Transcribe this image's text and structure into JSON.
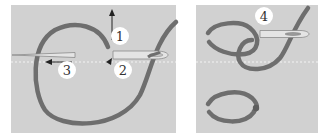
{
  "diagram": {
    "colors": {
      "background": "#d1d1d1",
      "thread": "#6e6e6e",
      "needle_fill": "#e4e4e4",
      "needle_stroke": "#8a8a8a",
      "badge_fill": "#ffffff",
      "arrow": "#222222",
      "fabric_line": "#e8e8e8"
    },
    "panels": [
      {
        "id": "left",
        "steps": [
          {
            "number": "1",
            "description": "pull thread up"
          },
          {
            "number": "2",
            "description": "insert needle"
          },
          {
            "number": "3",
            "description": "push needle left"
          }
        ]
      },
      {
        "id": "right",
        "steps": [
          {
            "number": "4",
            "description": "needle through loop"
          }
        ]
      }
    ]
  }
}
